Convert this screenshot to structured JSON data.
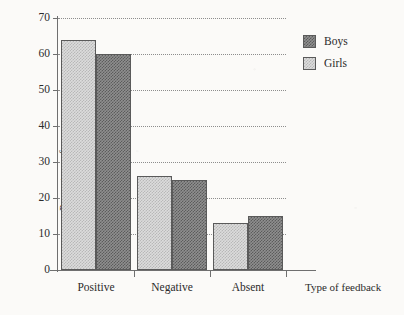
{
  "chart_data": {
    "type": "bar",
    "title": "",
    "xlabel": "Type of feedback",
    "ylabel": "Percentage of responses",
    "categories": [
      "Positive",
      "Negative",
      "Absent"
    ],
    "series": [
      {
        "name": "Girls",
        "values": [
          64,
          26,
          13
        ],
        "color": "#dcdcdc",
        "pattern": "light-checker"
      },
      {
        "name": "Boys",
        "values": [
          60,
          25,
          15
        ],
        "color": "#8f8f8f",
        "pattern": "dark-checker"
      }
    ],
    "series_order_in_group": [
      "Girls",
      "Boys"
    ],
    "ylim": [
      0,
      70
    ],
    "yticks": [
      0,
      10,
      20,
      30,
      40,
      50,
      60,
      70
    ],
    "ytick_labels": [
      "0",
      "10",
      "20",
      "30",
      "40",
      "50",
      "60",
      "70"
    ],
    "grid": "horizontal-dotted",
    "legend_position": "top-right-outside",
    "legend_entries": [
      "Boys",
      "Girls"
    ],
    "background_color": "#fbfaf8",
    "axis_color": "#6f6f6f"
  }
}
